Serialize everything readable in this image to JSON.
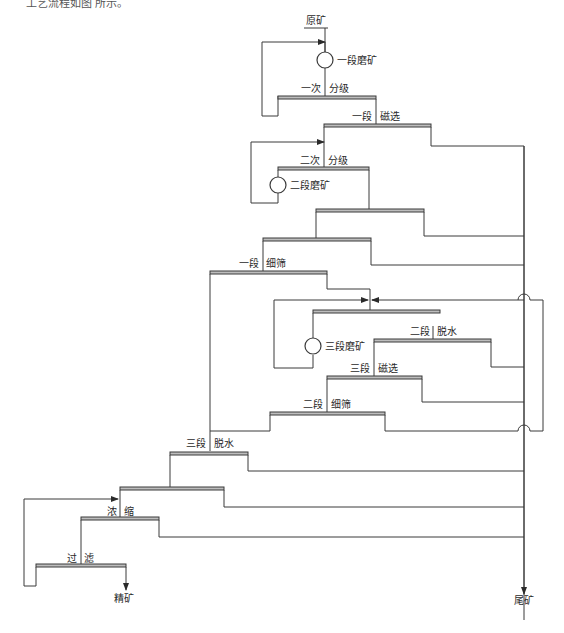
{
  "caption": "工艺流程如图 所示。",
  "diagram": {
    "input": "原矿",
    "outputs": {
      "concentrate": "精矿",
      "tailings": "尾矿"
    },
    "stages": [
      {
        "id": "grind1",
        "type": "mill",
        "label": "一段磨矿"
      },
      {
        "id": "class1",
        "type": "screen",
        "label_left": "一次",
        "label_right": "分级"
      },
      {
        "id": "mag1",
        "type": "screen",
        "label_left": "一段",
        "label_right": "磁选"
      },
      {
        "id": "class2",
        "type": "screen",
        "label_left": "二次",
        "label_right": "分级"
      },
      {
        "id": "grind2",
        "type": "mill",
        "label": "二段磨矿"
      },
      {
        "id": "mag2",
        "type": "screen",
        "label_left": "",
        "label_right": ""
      },
      {
        "id": "mag3",
        "type": "screen",
        "label_left": "",
        "label_right": ""
      },
      {
        "id": "fine1",
        "type": "screen",
        "label_left": "一段",
        "label_right": "细筛"
      },
      {
        "id": "dewater2",
        "type": "screen",
        "label_left": "二段",
        "label_right": "脱水"
      },
      {
        "id": "grind3",
        "type": "mill",
        "label": "三段磨矿"
      },
      {
        "id": "magsep3",
        "type": "screen",
        "label_left": "三段",
        "label_right": "磁选"
      },
      {
        "id": "fine2",
        "type": "screen",
        "label_left": "二段",
        "label_right": "细筛"
      },
      {
        "id": "dewater3",
        "type": "screen",
        "label_left": "三段",
        "label_right": "脱水"
      },
      {
        "id": "mag_final",
        "type": "screen",
        "label_left": "",
        "label_right": ""
      },
      {
        "id": "thicken",
        "type": "screen",
        "label_left": "浓",
        "label_right": "缩"
      },
      {
        "id": "filter",
        "type": "screen",
        "label_left": "过",
        "label_right": "滤"
      }
    ]
  }
}
